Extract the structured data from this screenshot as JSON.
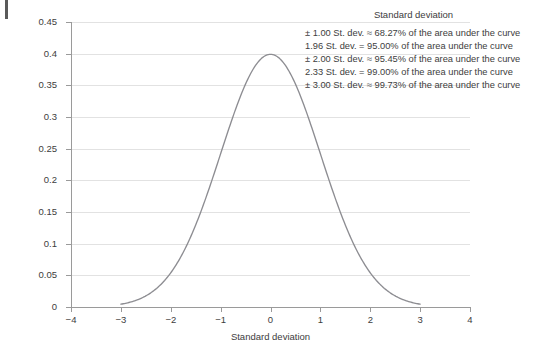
{
  "figure": {
    "background_color": "#ffffff",
    "curve_color": "#8d8d92",
    "grid_color": "#e2e2e2",
    "axis_color": "#9a9a9a",
    "text_color": "#3d3d3d"
  },
  "legend": {
    "title": "Standard deviation",
    "lines": [
      "± 1.00 St. dev. ≈ 68.27% of the area under the curve",
      "1.96 St. dev. = 95.00% of the area under the curve",
      "± 2.00 St. dev. ≈ 95.45% of the area under the curve",
      "2.33 St. dev. = 99.00% of the area under the curve",
      "± 3.00 St. dev. ≈ 99.73% of the area under the curve"
    ]
  },
  "chart_data": {
    "type": "line",
    "title": "",
    "xlabel": "Standard deviation",
    "ylabel": "Frequency of the occurrence of each outcome",
    "xlim": [
      -4,
      4
    ],
    "ylim": [
      0,
      0.45
    ],
    "xticks": [
      -4,
      -3,
      -2,
      -1,
      0,
      1,
      2,
      3,
      4
    ],
    "xticklabels": [
      "−4",
      "−3",
      "−2",
      "−1",
      "0",
      "1",
      "2",
      "3",
      "4"
    ],
    "yticks": [
      0,
      0.05,
      0.1,
      0.15,
      0.2,
      0.25,
      0.3,
      0.35,
      0.4,
      0.45
    ],
    "yticklabels": [
      "0",
      "0.05",
      "0.1",
      "0.15",
      "0.2",
      "0.25",
      "0.3",
      "0.35",
      "0.4",
      "0.45"
    ],
    "grid": "horizontal",
    "legend_position": "top-right",
    "series": [
      {
        "name": "Standard normal distribution",
        "distribution": "normal",
        "mean": 0,
        "std_dev": 1,
        "peak_value": 0.3989,
        "x_range": [
          -3,
          3
        ],
        "x": [
          -3.0,
          -2.8,
          -2.6,
          -2.4,
          -2.2,
          -2.0,
          -1.8,
          -1.6,
          -1.4,
          -1.2,
          -1.0,
          -0.8,
          -0.6,
          -0.4,
          -0.2,
          0.0,
          0.2,
          0.4,
          0.6,
          0.8,
          1.0,
          1.2,
          1.4,
          1.6,
          1.8,
          2.0,
          2.2,
          2.4,
          2.6,
          2.8,
          3.0
        ],
        "y": [
          0.0044,
          0.0079,
          0.0136,
          0.0224,
          0.0355,
          0.054,
          0.079,
          0.1109,
          0.1497,
          0.1942,
          0.242,
          0.2897,
          0.3332,
          0.3683,
          0.391,
          0.3989,
          0.391,
          0.3683,
          0.3332,
          0.2897,
          0.242,
          0.1942,
          0.1497,
          0.1109,
          0.079,
          0.054,
          0.0355,
          0.0224,
          0.0136,
          0.0079,
          0.0044
        ]
      }
    ],
    "annotations": [
      "± 1.00 St. dev. ≈ 68.27% of the area under the curve",
      "1.96 St. dev. = 95.00% of the area under the curve",
      "± 2.00 St. dev. ≈ 95.45% of the area under the curve",
      "2.33 St. dev. = 99.00% of the area under the curve",
      "± 3.00 St. dev. ≈ 99.73% of the area under the curve"
    ]
  }
}
